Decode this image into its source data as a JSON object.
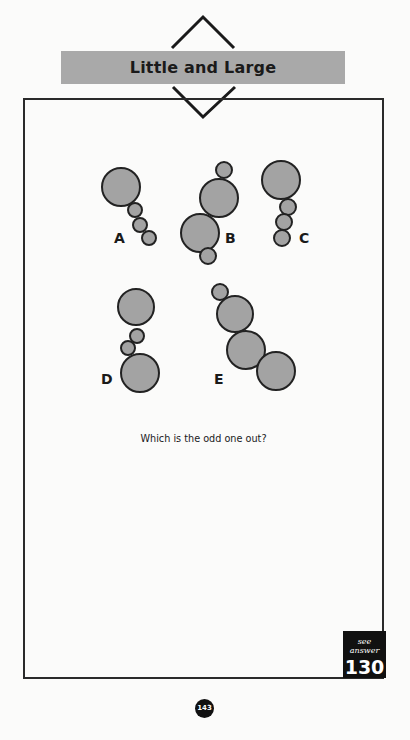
{
  "puzzle": {
    "title": "Little and Large",
    "question": "Which is the odd one out?",
    "answer_caption": "see answer",
    "answer_page": "130",
    "page_number": "143"
  },
  "style": {
    "circle_fill": "#a3a3a3",
    "circle_stroke": "#222222",
    "banner_color": "#a9a9a9"
  },
  "figures": [
    {
      "label": "A",
      "label_pos": [
        114,
        243
      ],
      "circles": [
        [
          121,
          187,
          19
        ],
        [
          135,
          210,
          7
        ],
        [
          140,
          225,
          7
        ],
        [
          149,
          238,
          7
        ]
      ]
    },
    {
      "label": "B",
      "label_pos": [
        225,
        243
      ],
      "circles": [
        [
          224,
          170,
          8
        ],
        [
          219,
          198,
          19
        ],
        [
          200,
          233,
          19
        ],
        [
          208,
          256,
          8
        ]
      ]
    },
    {
      "label": "C",
      "label_pos": [
        299,
        243
      ],
      "circles": [
        [
          281,
          180,
          19
        ],
        [
          288,
          207,
          8
        ],
        [
          284,
          222,
          8
        ],
        [
          282,
          238,
          8
        ]
      ]
    },
    {
      "label": "D",
      "label_pos": [
        101,
        384
      ],
      "circles": [
        [
          136,
          307,
          18
        ],
        [
          137,
          336,
          7
        ],
        [
          128,
          348,
          7
        ],
        [
          140,
          373,
          19
        ]
      ]
    },
    {
      "label": "E",
      "label_pos": [
        214,
        384
      ],
      "circles": [
        [
          220,
          292,
          8
        ],
        [
          235,
          314,
          18
        ],
        [
          246,
          350,
          19
        ],
        [
          276,
          371,
          19
        ]
      ]
    }
  ]
}
